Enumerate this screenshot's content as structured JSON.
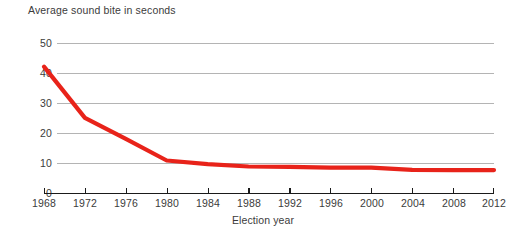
{
  "chart_data": {
    "type": "line",
    "title": "Average sound bite in seconds",
    "xlabel": "Election year",
    "ylabel": "",
    "x": [
      1968,
      1972,
      1976,
      1980,
      1984,
      1988,
      1992,
      1996,
      2000,
      2004,
      2008,
      2012
    ],
    "categories": [
      "1968",
      "1972",
      "1976",
      "1980",
      "1984",
      "1988",
      "1992",
      "1996",
      "2000",
      "2004",
      "2008",
      "2012"
    ],
    "values": [
      42.3,
      25.2,
      18.2,
      11.0,
      9.8,
      9.0,
      8.9,
      8.6,
      8.6,
      7.9,
      7.8,
      7.8
    ],
    "series": [
      {
        "name": "Average sound bite in seconds",
        "color": "#e8231a",
        "values": [
          42.3,
          25.2,
          18.2,
          11.0,
          9.8,
          9.0,
          8.9,
          8.6,
          8.6,
          7.9,
          7.8,
          7.8
        ]
      }
    ],
    "xlim": [
      1968,
      2012
    ],
    "ylim": [
      0,
      50
    ],
    "ytick_labels": [
      "0",
      "10",
      "20",
      "30",
      "40",
      "50"
    ],
    "ytick_values": [
      0,
      10,
      20,
      30,
      40,
      50
    ],
    "xtick_labels": [
      "1968",
      "1972",
      "1976",
      "1980",
      "1984",
      "1988",
      "1992",
      "1996",
      "2000",
      "2004",
      "2008",
      "2012"
    ],
    "grid": "horizontal",
    "legend": "none",
    "line_color": "#e8231a",
    "grid_color": "#b4b4b4",
    "axis_color": "#1a1a1a",
    "text_color": "#3b3b3b",
    "background": "#ffffff"
  }
}
